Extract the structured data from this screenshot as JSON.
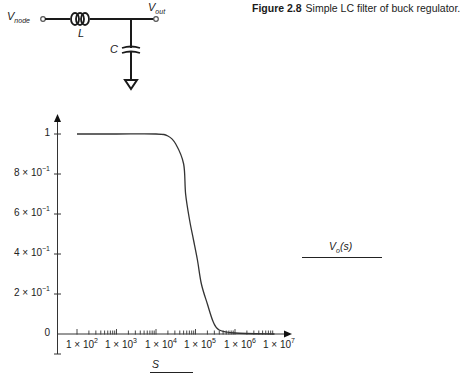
{
  "figure": {
    "number": "Figure 2.8",
    "caption": "Simple LC filter of buck regulator."
  },
  "circuit": {
    "input_label": "V",
    "input_sub": "node",
    "output_label": "V",
    "output_sub": "out",
    "inductor_label": "L",
    "capacitor_label": "C"
  },
  "plot_labels": {
    "side_label_main": "V",
    "side_label_sub": "o",
    "side_label_arg": "(s)",
    "x_label": "S"
  },
  "y_ticks": [
    {
      "mantissa": "1",
      "exp": "",
      "value": 1.0
    },
    {
      "mantissa": "8 × 10",
      "exp": "−1",
      "value": 0.8
    },
    {
      "mantissa": "6 × 10",
      "exp": "−1",
      "value": 0.6
    },
    {
      "mantissa": "4 × 10",
      "exp": "−1",
      "value": 0.4
    },
    {
      "mantissa": "2 × 10",
      "exp": "−1",
      "value": 0.2
    },
    {
      "mantissa": "0",
      "exp": "",
      "value": 0.0
    }
  ],
  "x_ticks": [
    {
      "mantissa": "1 × 10",
      "exp": "2"
    },
    {
      "mantissa": "1 × 10",
      "exp": "3"
    },
    {
      "mantissa": "1 × 10",
      "exp": "4"
    },
    {
      "mantissa": "1 × 10",
      "exp": "5"
    },
    {
      "mantissa": "1 × 10",
      "exp": "6"
    },
    {
      "mantissa": "1 × 10",
      "exp": "7"
    }
  ],
  "chart_data": {
    "type": "line",
    "title": "",
    "xlabel": "S",
    "ylabel": "Vo(s)",
    "x_scale": "log",
    "xlim": [
      100,
      10000000
    ],
    "ylim": [
      0,
      1
    ],
    "grid": false,
    "legend": "none",
    "x_tick_labels": [
      "1×10^2",
      "1×10^3",
      "1×10^4",
      "1×10^5",
      "1×10^6",
      "1×10^7"
    ],
    "y_tick_labels": [
      "0",
      "2×10^-1",
      "4×10^-1",
      "6×10^-1",
      "8×10^-1",
      "1"
    ],
    "series": [
      {
        "name": "Vo(s)",
        "x": [
          100,
          1000,
          10000,
          20000,
          31600,
          50100,
          56200,
          70800,
          89100,
          112000,
          141000,
          200000,
          282000,
          398000,
          1000000,
          10000000
        ],
        "values": [
          1.0,
          1.0,
          1.0,
          0.99,
          0.95,
          0.85,
          0.7,
          0.57,
          0.47,
          0.37,
          0.25,
          0.15,
          0.06,
          0.02,
          0.005,
          0.0
        ]
      }
    ]
  }
}
